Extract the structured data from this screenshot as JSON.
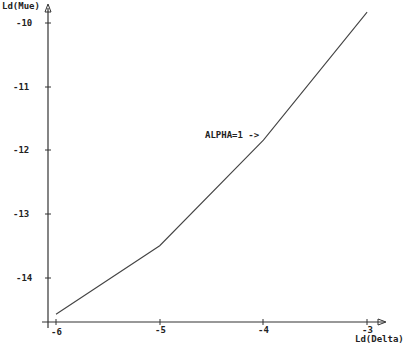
{
  "chart_data": {
    "type": "line",
    "title": "",
    "xlabel": "Ld(Delta)",
    "ylabel": "Ld(Mue)",
    "x_ticks": [
      "-6",
      "-5",
      "-4",
      "-3"
    ],
    "y_ticks": [
      "-10",
      "-11",
      "-12",
      "-13",
      "-14"
    ],
    "xlim": [
      -6.05,
      -2.8
    ],
    "ylim": [
      -14.7,
      -9.8
    ],
    "grid": false,
    "legend": "none",
    "series": [
      {
        "name": "ALPHA=1",
        "x": [
          -6,
          -5,
          -4,
          -3
        ],
        "y": [
          -14.55,
          -13.48,
          -11.83,
          -9.83
        ]
      }
    ],
    "annotations": [
      {
        "text": "ALPHA=1 ->",
        "x": -4.35,
        "y": -11.8
      }
    ]
  },
  "axes": {
    "x_label": "Ld(Delta)",
    "y_label": "Ld(Mue)"
  },
  "annotation": {
    "text": "ALPHA=1 ->"
  }
}
